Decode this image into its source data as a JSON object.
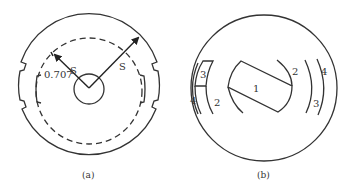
{
  "figure": {
    "panels": [
      {
        "id": "a",
        "caption": "(a)",
        "labels": {
          "inner_radius": "0.707",
          "s_left": "S",
          "s_right": "S"
        }
      },
      {
        "id": "b",
        "caption": "(b)",
        "labels": {
          "region_1": "1",
          "region_2_left": "2",
          "region_2_right": "2",
          "region_3_left": "3",
          "region_3_right": "3",
          "region_4_left": "4",
          "region_4_right": "4"
        }
      }
    ],
    "colors": {
      "stroke": "#333333",
      "background": "#ffffff"
    }
  }
}
